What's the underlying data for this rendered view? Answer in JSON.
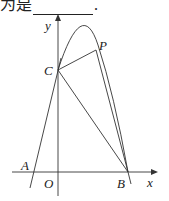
{
  "question_fragment": {
    "prefix": "为是",
    "suffix": "."
  },
  "diagram": {
    "axis_labels": {
      "x": "x",
      "y": "y"
    },
    "origin_label": "O",
    "points": {
      "A": "A",
      "B": "B",
      "C": "C",
      "P": "P"
    },
    "stroke_color": "#333333"
  }
}
